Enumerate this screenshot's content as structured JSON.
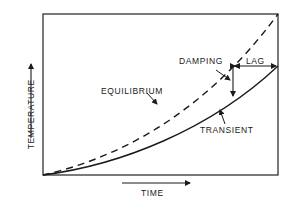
{
  "diagram": {
    "title": "",
    "axes": {
      "x_label": "TIME",
      "y_label": "TEMPERATURE"
    },
    "curves": {
      "equilibrium": {
        "label": "EQUILIBRIUM",
        "style": "dashed"
      },
      "transient": {
        "label": "TRANSIENT",
        "style": "solid"
      }
    },
    "annotations": {
      "damping": "DAMPING",
      "lag": "LAG"
    },
    "colors": {
      "ink": "#1a1a1a",
      "background": "#ffffff"
    }
  }
}
